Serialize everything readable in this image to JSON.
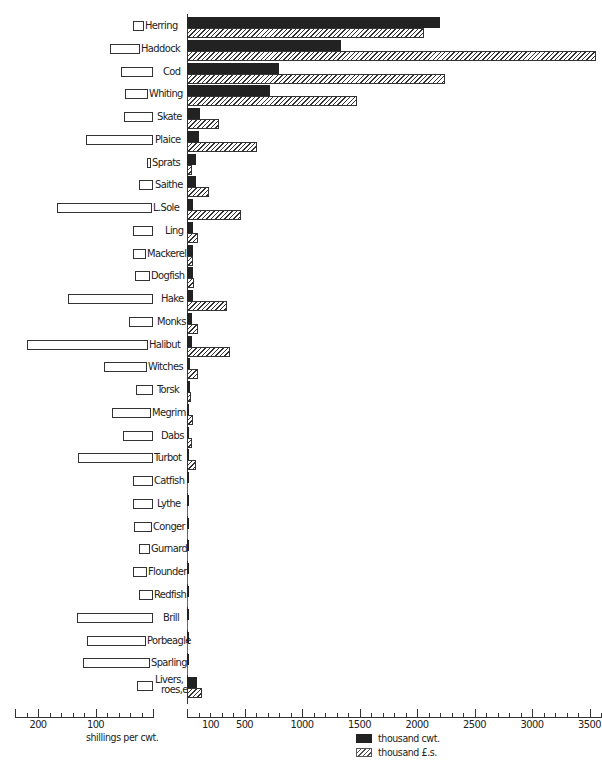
{
  "chart_data": {
    "type": "bar",
    "orientation": "horizontal",
    "title": "",
    "categories": [
      "Herring",
      "Haddock",
      "Cod",
      "Whiting",
      "Skate",
      "Plaice",
      "Sprats",
      "Saithe",
      "L.Sole",
      "Ling",
      "Mackerel",
      "Dogfish",
      "Hake",
      "Monks",
      "Halibut",
      "Witches",
      "Torsk",
      "Megrim",
      "Dabs",
      "Turbot",
      "Catfish",
      "Lythe",
      "Conger",
      "Gurnard",
      "Flounder",
      "Redfish",
      "Brill",
      "Porbeagle",
      "Sparling",
      "Livers, roes,etc"
    ],
    "series": [
      {
        "name": "thousand cwt.",
        "axis": "right",
        "color": "#222222",
        "values": [
          2200,
          1340,
          800,
          720,
          110,
          100,
          80,
          80,
          50,
          55,
          50,
          50,
          50,
          45,
          40,
          25,
          25,
          15,
          15,
          15,
          5,
          5,
          5,
          3,
          3,
          3,
          3,
          3,
          3,
          85
        ]
      },
      {
        "name": "thousand £.s.",
        "axis": "right",
        "pattern": "hatched",
        "values": [
          2060,
          3560,
          2240,
          1480,
          280,
          610,
          40,
          190,
          470,
          95,
          55,
          60,
          350,
          95,
          370,
          95,
          35,
          55,
          40,
          80,
          5,
          5,
          3,
          2,
          2,
          2,
          2,
          2,
          2,
          130
        ]
      },
      {
        "name": "shillings per cwt.",
        "axis": "left",
        "pattern": "outline",
        "values": [
          19,
          53,
          55,
          40,
          50,
          117,
          7,
          24,
          165,
          35,
          22,
          26,
          147,
          41,
          210,
          74,
          29,
          67,
          53,
          130,
          34,
          34,
          31,
          19,
          24,
          24,
          133,
          102,
          116,
          28
        ]
      }
    ],
    "left_axis": {
      "label": "shillings per cwt.",
      "ticks": [
        "200",
        "100"
      ],
      "range": [
        250,
        0
      ],
      "direction": "reversed"
    },
    "right_axis": {
      "ticks": [
        "100",
        "500",
        "1000",
        "1500",
        "2000",
        "2500",
        "3000",
        "3500"
      ],
      "range": [
        0,
        3600
      ]
    },
    "legend": [
      {
        "label": "thousand cwt.",
        "style": "solid-dark"
      },
      {
        "label": "thousand £.s.",
        "style": "hatched"
      }
    ],
    "legend_position": "bottom-center",
    "grid": false
  },
  "labels": {
    "left_axis_title": "shillings per cwt.",
    "legend_cwt": "thousand cwt.",
    "legend_value": "thousand £.s."
  }
}
